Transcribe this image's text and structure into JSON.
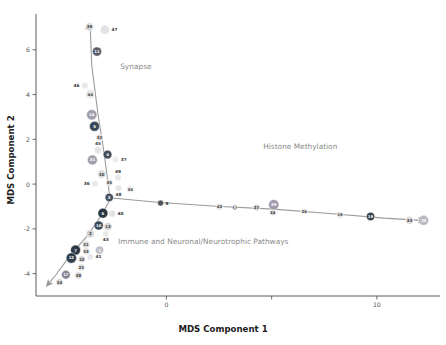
{
  "chart_data": {
    "type": "scatter",
    "title": "",
    "xlabel": "MDS Component 1",
    "ylabel": "MDS Component 2",
    "xlim": [
      -6.2,
      13.0
    ],
    "ylim": [
      -5.0,
      7.6
    ],
    "xticks": [
      0,
      10
    ],
    "xtick_labels": [
      "0",
      "10"
    ],
    "yticks": [
      6,
      4,
      2,
      0,
      -2,
      -4
    ],
    "ytick_labels": [
      "6",
      "4",
      "2",
      "0",
      "-2",
      "-4"
    ],
    "grid": false,
    "legend": "none",
    "annotations": [
      {
        "text": "Synapse",
        "x": -2.2,
        "y": 5.15,
        "color": "#9a9a9a"
      },
      {
        "text": "Histone Methylation",
        "x": 4.6,
        "y": 1.55,
        "color": "#8f8f8f"
      },
      {
        "text": "Immune and Neuronal/Neurotrophic Pathways",
        "x": -2.3,
        "y": -2.68,
        "color": "#8b8b8b"
      }
    ],
    "branches": [
      {
        "name": "Synapse",
        "arrow": "up",
        "points": [
          [
            -2.7,
            -0.52
          ],
          [
            -2.95,
            1.3
          ],
          [
            -3.25,
            3.1
          ],
          [
            -3.55,
            5.3
          ],
          [
            -3.62,
            6.95
          ]
        ]
      },
      {
        "name": "Histone Methylation",
        "arrow": "right",
        "points": [
          [
            -2.6,
            -0.62
          ],
          [
            -0.3,
            -0.82
          ],
          [
            2.55,
            -1.0
          ],
          [
            5.1,
            -1.12
          ],
          [
            7.6,
            -1.3
          ],
          [
            10.35,
            -1.52
          ],
          [
            12.1,
            -1.62
          ]
        ]
      },
      {
        "name": "Immune and Neuronal/Neurotrophic Pathways",
        "arrow": "down-left",
        "points": [
          [
            -2.62,
            -0.6
          ],
          [
            -3.1,
            -1.4
          ],
          [
            -3.75,
            -2.3
          ],
          [
            -4.55,
            -3.15
          ],
          [
            -5.25,
            -4.05
          ],
          [
            -5.6,
            -4.45
          ]
        ]
      }
    ],
    "nodes": [
      {
        "id": "39",
        "x": -3.66,
        "y": 7.02,
        "r": 4.2,
        "color": "#d8d8d8",
        "label_pos": "inside",
        "dark": false
      },
      {
        "id": "47",
        "x": -2.92,
        "y": 6.9,
        "r": 4.6,
        "color": "#e2e2e2",
        "label_pos": "right",
        "dark": false
      },
      {
        "id": "11",
        "x": -3.3,
        "y": 5.92,
        "r": 4.6,
        "color": "#4f4f5e",
        "label_pos": "inside",
        "dark": true
      },
      {
        "id": "46",
        "x": -3.88,
        "y": 4.4,
        "r": 3.4,
        "color": "#e8e8e8",
        "label_pos": "left",
        "dark": false
      },
      {
        "id": "44",
        "x": -3.62,
        "y": 4.02,
        "r": 4.6,
        "color": "#e6e6e6",
        "label_pos": "inside",
        "dark": false
      },
      {
        "id": "16",
        "x": -3.55,
        "y": 3.1,
        "r": 5.2,
        "color": "#9a9aa6",
        "label_pos": "inside",
        "dark": true
      },
      {
        "id": "5",
        "x": -3.42,
        "y": 2.58,
        "r": 5.0,
        "color": "#2f3f4f",
        "label_pos": "inside",
        "dark": true
      },
      {
        "id": "32",
        "x": -3.18,
        "y": 2.08,
        "r": 3.6,
        "color": "#dcdcdc",
        "label_pos": "inside",
        "dark": false
      },
      {
        "id": "45",
        "x": -3.25,
        "y": 1.52,
        "r": 3.8,
        "color": "#e4e4e4",
        "label_pos": "above",
        "dark": false
      },
      {
        "id": "4",
        "x": -2.8,
        "y": 1.32,
        "r": 4.4,
        "color": "#3a4550",
        "label_pos": "inside",
        "dark": true
      },
      {
        "id": "31",
        "x": -3.52,
        "y": 1.08,
        "r": 5.0,
        "color": "#9b9ba8",
        "label_pos": "inside",
        "dark": true
      },
      {
        "id": "37",
        "x": -2.42,
        "y": 1.1,
        "r": 3.3,
        "color": "#ececec",
        "label_pos": "right",
        "dark": false
      },
      {
        "id": "30",
        "x": -3.08,
        "y": 0.45,
        "r": 4.2,
        "color": "#dadada",
        "label_pos": "inside",
        "dark": false
      },
      {
        "id": "36",
        "x": -3.4,
        "y": 0.02,
        "r": 3.2,
        "color": "#e8e8e8",
        "label_pos": "left",
        "dark": false
      },
      {
        "id": "35",
        "x": -2.72,
        "y": 0.06,
        "r": 3.4,
        "color": "#dedede",
        "label_pos": "inside",
        "dark": false
      },
      {
        "id": "49",
        "x": -2.3,
        "y": 0.3,
        "r": 3.2,
        "color": "#e6e6e6",
        "label_pos": "above",
        "dark": false
      },
      {
        "id": "48",
        "x": -2.28,
        "y": -0.18,
        "r": 3.2,
        "color": "#e4e4e4",
        "label_pos": "below",
        "dark": false
      },
      {
        "id": "3",
        "x": -2.72,
        "y": -0.6,
        "r": 4.2,
        "color": "#3b4a58",
        "label_pos": "inside",
        "dark": true
      },
      {
        "id": "34",
        "x": -1.72,
        "y": -0.22,
        "r": 3.6,
        "color": "#ededed",
        "label_pos": "inside",
        "dark": false
      },
      {
        "id": "9",
        "x": -0.28,
        "y": -0.85,
        "r": 3.0,
        "color": "#4a4a55",
        "label_pos": "right",
        "dark": true
      },
      {
        "id": "6",
        "x": -3.02,
        "y": -1.3,
        "r": 5.0,
        "color": "#1f2d3a",
        "label_pos": "inside",
        "dark": true
      },
      {
        "id": "40",
        "x": -2.58,
        "y": -1.32,
        "r": 3.4,
        "color": "#e0e0e0",
        "label_pos": "right",
        "dark": false
      },
      {
        "id": "10",
        "x": -3.22,
        "y": -1.85,
        "r": 4.6,
        "color": "#2e3e4e",
        "label_pos": "inside",
        "dark": true
      },
      {
        "id": "13",
        "x": -2.78,
        "y": -1.9,
        "r": 4.2,
        "color": "#d6d6d6",
        "label_pos": "inside",
        "dark": false
      },
      {
        "id": "43",
        "x": -2.88,
        "y": -2.22,
        "r": 3.2,
        "color": "#e8e8e8",
        "label_pos": "below",
        "dark": false
      },
      {
        "id": "2",
        "x": -3.62,
        "y": -2.22,
        "r": 4.0,
        "color": "#d0d0d0",
        "label_pos": "inside",
        "dark": false
      },
      {
        "id": "21",
        "x": -3.82,
        "y": -2.7,
        "r": 3.8,
        "color": "#dedede",
        "label_pos": "inside",
        "dark": false
      },
      {
        "id": "1",
        "x": -3.18,
        "y": -2.95,
        "r": 4.2,
        "color": "#bdbdc6",
        "label_pos": "inside",
        "dark": true
      },
      {
        "id": "7",
        "x": -4.32,
        "y": -2.95,
        "r": 5.0,
        "color": "#222f3c",
        "label_pos": "inside",
        "dark": true
      },
      {
        "id": "33",
        "x": -3.82,
        "y": -3.0,
        "r": 3.4,
        "color": "#dcdcdc",
        "label_pos": "inside",
        "dark": false
      },
      {
        "id": "12",
        "x": -4.52,
        "y": -3.3,
        "r": 5.2,
        "color": "#253442",
        "label_pos": "inside",
        "dark": true
      },
      {
        "id": "22",
        "x": -4.02,
        "y": -3.35,
        "r": 3.6,
        "color": "#d8d8d8",
        "label_pos": "inside",
        "dark": false
      },
      {
        "id": "41",
        "x": -3.62,
        "y": -3.25,
        "r": 3.2,
        "color": "#e6e6e6",
        "label_pos": "right",
        "dark": false
      },
      {
        "id": "23",
        "x": -4.05,
        "y": -3.72,
        "r": 3.6,
        "color": "#dfdfdf",
        "label_pos": "inside",
        "dark": false
      },
      {
        "id": "17",
        "x": -4.78,
        "y": -4.05,
        "r": 4.4,
        "color": "#808090",
        "label_pos": "inside",
        "dark": true
      },
      {
        "id": "38",
        "x": -4.18,
        "y": -4.08,
        "r": 3.6,
        "color": "#d7d7d7",
        "label_pos": "inside",
        "dark": false
      },
      {
        "id": "24",
        "x": -5.08,
        "y": -4.38,
        "r": 3.6,
        "color": "#d5d5d5",
        "label_pos": "inside",
        "dark": false
      },
      {
        "id": "42",
        "x": 2.52,
        "y": -1.02,
        "r": 3.4,
        "color": "#e2e2e2",
        "label_pos": "inside",
        "dark": false
      },
      {
        "id": "8",
        "x": 3.25,
        "y": -1.05,
        "r": 2.4,
        "color": "#5a5a66",
        "label_pos": "inside",
        "dark": true
      },
      {
        "id": "27",
        "x": 4.28,
        "y": -1.05,
        "r": 3.4,
        "color": "#d6d6d6",
        "label_pos": "inside",
        "dark": false
      },
      {
        "id": "29",
        "x": 5.1,
        "y": -0.92,
        "r": 5.2,
        "color": "#9a95a8",
        "label_pos": "inside",
        "dark": true
      },
      {
        "id": "14",
        "x": 5.05,
        "y": -1.28,
        "r": 2.8,
        "color": "#c8c8c8",
        "label_pos": "inside",
        "dark": false
      },
      {
        "id": "26",
        "x": 6.55,
        "y": -1.22,
        "r": 3.2,
        "color": "#eaeaea",
        "label_pos": "inside",
        "dark": false
      },
      {
        "id": "15",
        "x": 8.25,
        "y": -1.38,
        "r": 3.2,
        "color": "#e4e4e4",
        "label_pos": "inside",
        "dark": false
      },
      {
        "id": "19",
        "x": 9.7,
        "y": -1.45,
        "r": 4.2,
        "color": "#2b3a48",
        "label_pos": "inside",
        "dark": true
      },
      {
        "id": "33b",
        "x": 11.55,
        "y": -1.62,
        "r": 4.2,
        "color": "#dcdcdc",
        "label_pos": "inside",
        "dark": false,
        "display": "33"
      },
      {
        "id": "25",
        "x": 12.22,
        "y": -1.62,
        "r": 5.0,
        "color": "#b6b6be",
        "label_pos": "inside",
        "dark": true
      }
    ]
  }
}
